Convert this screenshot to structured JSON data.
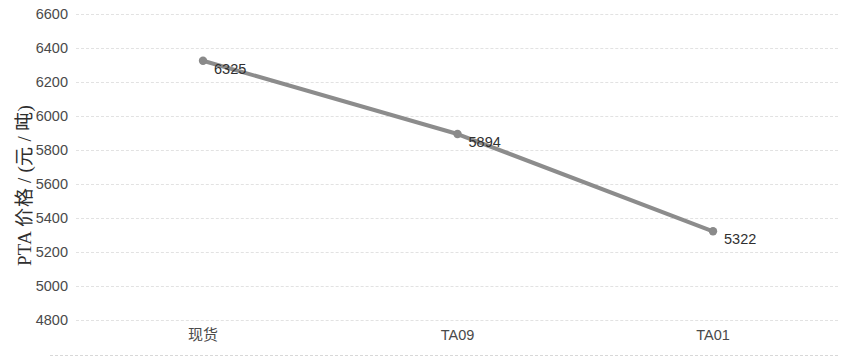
{
  "chart_data": {
    "type": "line",
    "title": "",
    "xlabel": "",
    "ylabel": "PTA 价格 / (元 / 吨)",
    "categories": [
      "现货",
      "TA09",
      "TA01"
    ],
    "values": [
      6325,
      5894,
      5322
    ],
    "data_labels": [
      "6325",
      "5894",
      "5322"
    ],
    "ylim": [
      4800,
      6600
    ],
    "ytick_step": 200,
    "yticks": [
      6600,
      6400,
      6200,
      6000,
      5800,
      5600,
      5400,
      5200,
      5000,
      4800
    ],
    "ytick_labels": [
      "6600",
      "6400",
      "6200",
      "6000",
      "5800",
      "5600",
      "5400",
      "5200",
      "5000",
      "4800"
    ],
    "grid": true,
    "grid_axis": "y",
    "grid_style": "dashed",
    "legend": false,
    "series": [
      {
        "name": "PTA 价格",
        "values": [
          6325,
          5894,
          5322
        ],
        "color": "#8c8c8c",
        "marker": "circle",
        "line_width": 4
      }
    ]
  },
  "colors": {
    "series_line": "#8c8c8c",
    "marker_fill": "#8a8a8a",
    "gridline": "#e2e2e2",
    "axis_text": "#4a4a4a",
    "label_text": "#303030",
    "background": "#ffffff"
  },
  "axis": {
    "y_title": "PTA 价格 / (元 / 吨)",
    "y_ticks": [
      {
        "label": "6600",
        "value": 6600
      },
      {
        "label": "6400",
        "value": 6400
      },
      {
        "label": "6200",
        "value": 6200
      },
      {
        "label": "6000",
        "value": 6000
      },
      {
        "label": "5800",
        "value": 5800
      },
      {
        "label": "5600",
        "value": 5600
      },
      {
        "label": "5400",
        "value": 5400
      },
      {
        "label": "5200",
        "value": 5200
      },
      {
        "label": "5000",
        "value": 5000
      },
      {
        "label": "4800",
        "value": 4800
      }
    ],
    "x_categories": [
      {
        "label": "现货",
        "cjk": true
      },
      {
        "label": "TA09",
        "cjk": false
      },
      {
        "label": "TA01",
        "cjk": false
      }
    ]
  },
  "points": [
    {
      "category": "现货",
      "value": 6325,
      "label": "6325"
    },
    {
      "category": "TA09",
      "value": 5894,
      "label": "5894"
    },
    {
      "category": "TA01",
      "value": 5322,
      "label": "5322"
    }
  ]
}
